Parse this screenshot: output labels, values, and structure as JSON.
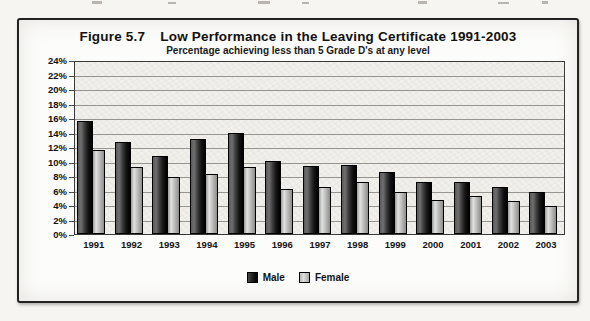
{
  "figure": {
    "label": "Figure 5.7",
    "title": "Low Performance in the Leaving Certificate 1991-2003",
    "subtitle": "Percentage achieving less than 5 Grade D's at any level"
  },
  "chart_data": {
    "type": "bar",
    "title": "Figure 5.7 Low Performance in the Leaving Certificate 1991-2003",
    "subtitle": "Percentage achieving less than 5 Grade D's at any level",
    "categories": [
      "1991",
      "1992",
      "1993",
      "1994",
      "1995",
      "1996",
      "1997",
      "1998",
      "1999",
      "2000",
      "2001",
      "2002",
      "2003"
    ],
    "series": [
      {
        "name": "Male",
        "color": "#1a1a1a",
        "values": [
          15.8,
          12.8,
          10.9,
          13.2,
          14.1,
          10.2,
          9.5,
          9.7,
          8.6,
          7.2,
          7.3,
          6.6,
          5.8
        ]
      },
      {
        "name": "Female",
        "color": "#c9c9c7",
        "values": [
          11.7,
          9.4,
          7.9,
          8.4,
          9.4,
          6.3,
          6.5,
          7.2,
          5.9,
          4.7,
          5.3,
          4.6,
          3.9
        ]
      }
    ],
    "ylim": [
      0,
      24
    ],
    "y_tick_step": 2,
    "y_tick_labels": [
      "24%",
      "22%",
      "20%",
      "18%",
      "16%",
      "14%",
      "12%",
      "10%",
      "8%",
      "6%",
      "4%",
      "2%",
      "0%"
    ],
    "xlabel": "",
    "ylabel": "",
    "grid": "horizontal",
    "legend_position": "bottom",
    "legend_labels": [
      "Male",
      "Female"
    ]
  }
}
